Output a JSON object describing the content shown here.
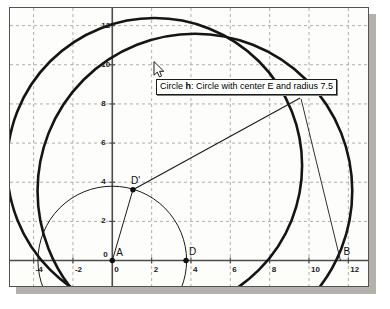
{
  "app": {
    "title": "Dynamic Geometry Graphics View",
    "panel_name": "graphics-view"
  },
  "tooltip": {
    "visible": true,
    "object_name": "Circle h",
    "prefix": "Circle ",
    "bold_part": "h",
    "suffix": ": Circle with center E and radius 7.5",
    "full_text": "Circle h: Circle with center E and radius 7.5",
    "x": 155,
    "y": 78
  },
  "cursor": {
    "name": "arrow-pointer",
    "x": 152,
    "y": 60
  },
  "colors": {
    "background": "#fdfdfb",
    "grid": "#9a9a9a",
    "axis": "#4b4b4b",
    "stroke_thick": "#151515",
    "stroke_thin": "#1a1a1a",
    "panel_border": "#56534f",
    "shadow": "#b4b0ac",
    "bleed_text": "#efe7e3"
  },
  "chart_data": {
    "type": "scatter",
    "title": "",
    "xlabel": "",
    "ylabel": "",
    "xlim": [
      -5.2,
      13.0
    ],
    "ylim": [
      -1.3,
      12.9
    ],
    "grid": true,
    "grid_step": 2,
    "legend": "none",
    "x_ticks": [
      "-4",
      "-2",
      "0",
      "2",
      "4",
      "6",
      "8",
      "10",
      "12"
    ],
    "x_tick_values": [
      -4,
      -2,
      0,
      2,
      4,
      6,
      8,
      10,
      12
    ],
    "y_ticks": [
      "0",
      "2",
      "4",
      "6",
      "8",
      "10",
      "12"
    ],
    "y_tick_values": [
      0,
      2,
      4,
      6,
      8,
      10,
      12
    ],
    "points": [
      {
        "label": "A",
        "x": 0.0,
        "y": 0.0,
        "dot": true,
        "label_dx": 4,
        "label_dy": -13
      },
      {
        "label": "D",
        "x": 3.75,
        "y": 0.0,
        "dot": true,
        "label_dx": 3,
        "label_dy": -14
      },
      {
        "label": "D'",
        "x": 1.05,
        "y": 3.62,
        "dot": true,
        "label_dx": -2,
        "label_dy": -14
      },
      {
        "label": "B",
        "x": 11.6,
        "y": 0.0,
        "dot": false,
        "label_dx": 3,
        "label_dy": -14
      },
      {
        "label": "F",
        "x": 9.55,
        "y": 8.45,
        "dot": false,
        "label_dx": 1,
        "label_dy": -12
      }
    ],
    "circles": [
      {
        "name": "circle-centered-A",
        "cx": 0.0,
        "cy": 0.0,
        "r": 3.78,
        "width": 1.0,
        "style": "thin"
      },
      {
        "name": "circle-h",
        "cx": 2.15,
        "cy": 4.85,
        "r": 7.5,
        "width": 2.6,
        "style": "thick"
      },
      {
        "name": "circle-large",
        "cx": 4.2,
        "cy": 3.55,
        "r": 8.0,
        "width": 2.6,
        "style": "thick"
      }
    ],
    "segments": [
      {
        "name": "segment-A-to-Dprime",
        "x1": 0.0,
        "y1": 0.0,
        "x2": 1.05,
        "y2": 3.62,
        "width": 1.0
      },
      {
        "name": "segment-Dprime-to-F",
        "x1": 1.05,
        "y1": 3.62,
        "x2": 9.55,
        "y2": 8.3,
        "width": 1.1
      },
      {
        "name": "segment-F-to-B",
        "x1": 9.6,
        "y1": 8.25,
        "x2": 11.6,
        "y2": 0.0,
        "width": 0.9
      }
    ]
  },
  "bleed_text": [
    {
      "text": "Save Point D",
      "x": 42,
      "y": 62,
      "size": 13
    },
    {
      "text": "Circle",
      "x": 30,
      "y": 112,
      "size": 13
    },
    {
      "text": "the center of the",
      "x": 30,
      "y": 152,
      "size": 11
    },
    {
      "text": "circle D and",
      "x": 30,
      "y": 170,
      "size": 11
    },
    {
      "text": "radius",
      "x": 30,
      "y": 188,
      "size": 11
    },
    {
      "text": "AD",
      "x": 30,
      "y": 206,
      "size": 11
    }
  ]
}
